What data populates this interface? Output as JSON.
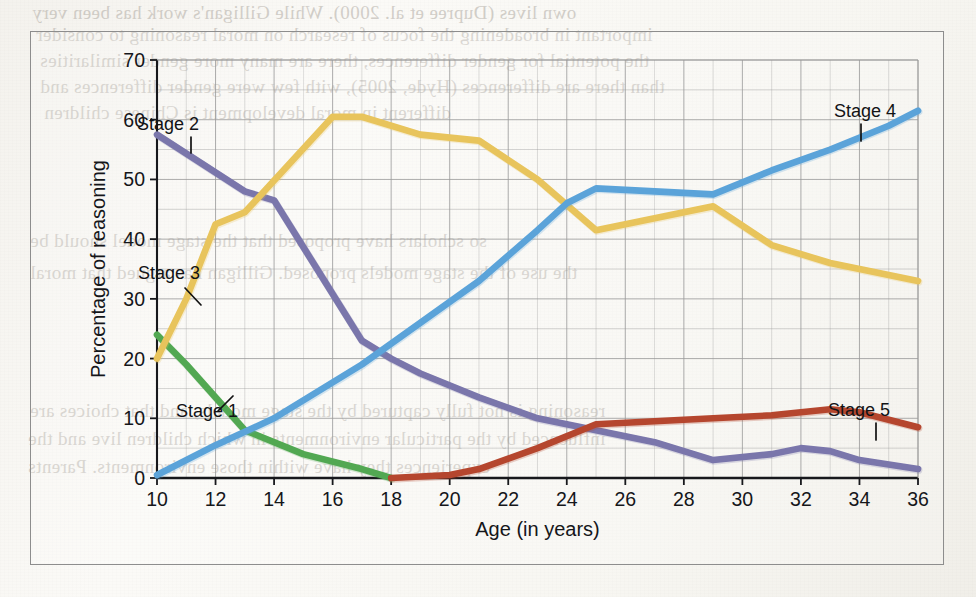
{
  "figure": {
    "frame_border_color": "#8d8d8d",
    "paper_color": "#faf9f6"
  },
  "chart_data": {
    "type": "line",
    "title": "",
    "xlabel": "Age (in years)",
    "ylabel": "Percentage of reasoning",
    "xlim": [
      10,
      36
    ],
    "ylim": [
      0,
      70
    ],
    "xticks": [
      10,
      12,
      14,
      16,
      18,
      20,
      22,
      24,
      26,
      28,
      30,
      32,
      34,
      36
    ],
    "yticks": [
      0,
      10,
      20,
      30,
      40,
      50,
      60,
      70
    ],
    "grid": "both-axes-minor-5-and-1",
    "grid_color": "#9a9a9a",
    "legend": "inline-labels-with-leader-lines",
    "series": [
      {
        "name": "Stage 1",
        "color": "#52a852",
        "x": [
          10,
          11,
          13,
          15,
          17,
          18
        ],
        "values": [
          24,
          19,
          8,
          4,
          1.5,
          0
        ]
      },
      {
        "name": "Stage 2",
        "color": "#7a76ab",
        "x": [
          10,
          13,
          14,
          17,
          18,
          19,
          21,
          23,
          25,
          27,
          29,
          31,
          32,
          33,
          34,
          36
        ],
        "values": [
          57.5,
          48,
          46.5,
          23,
          20,
          17.5,
          13.5,
          10,
          8,
          6,
          3,
          4,
          5,
          4.5,
          3,
          1.5
        ]
      },
      {
        "name": "Stage 3",
        "color": "#e8c45c",
        "x": [
          10,
          11,
          12,
          13,
          16,
          17,
          19,
          21,
          23,
          25,
          27,
          29,
          31,
          33,
          36
        ],
        "values": [
          20,
          30,
          42.5,
          44.5,
          60.5,
          60.5,
          57.5,
          56.5,
          50,
          41.5,
          43.5,
          45.5,
          39,
          36,
          33
        ]
      },
      {
        "name": "Stage 4",
        "color": "#5ba3d9",
        "x": [
          10,
          12,
          14,
          17,
          19,
          21,
          23,
          24,
          25,
          27,
          29,
          31,
          33,
          35,
          36
        ],
        "values": [
          0.5,
          5.5,
          10,
          19,
          26,
          33,
          41.5,
          46,
          48.5,
          48,
          47.5,
          51.5,
          55,
          59,
          61.5
        ]
      },
      {
        "name": "Stage 5",
        "color": "#b5462e",
        "x": [
          18,
          20,
          21,
          23,
          25,
          27,
          29,
          31,
          33,
          34,
          36
        ],
        "values": [
          0,
          0.5,
          1.5,
          5,
          9,
          9.5,
          10,
          10.5,
          11.5,
          11,
          8.5
        ]
      }
    ],
    "annotations": [
      {
        "text": "Stage 1",
        "series": "Stage 1"
      },
      {
        "text": "Stage 2",
        "series": "Stage 2"
      },
      {
        "text": "Stage 3",
        "series": "Stage 3"
      },
      {
        "text": "Stage 4",
        "series": "Stage 4"
      },
      {
        "text": "Stage 5",
        "series": "Stage 5"
      }
    ]
  },
  "page_bleed_text": [
    "own lives (Dupree et al. 2000). While Gilligan's work has been very",
    "important in broadening the focus of research on moral reasoning to consider",
    "the potential for gender differences, there are many more gender similarities",
    "than there are differences (Hyde, 2005), with few were gender differences and",
    "different in moral development is Chinese children",
    "so scholars have proposed that the stage model should be",
    "the use of the stage models proposed. Gilligan has argued that moral",
    "reasoning is not fully captured by the stage models, and that choices are",
    "influenced by the particular environments in which children live and the",
    "experiences they have within those environments. Parents"
  ]
}
